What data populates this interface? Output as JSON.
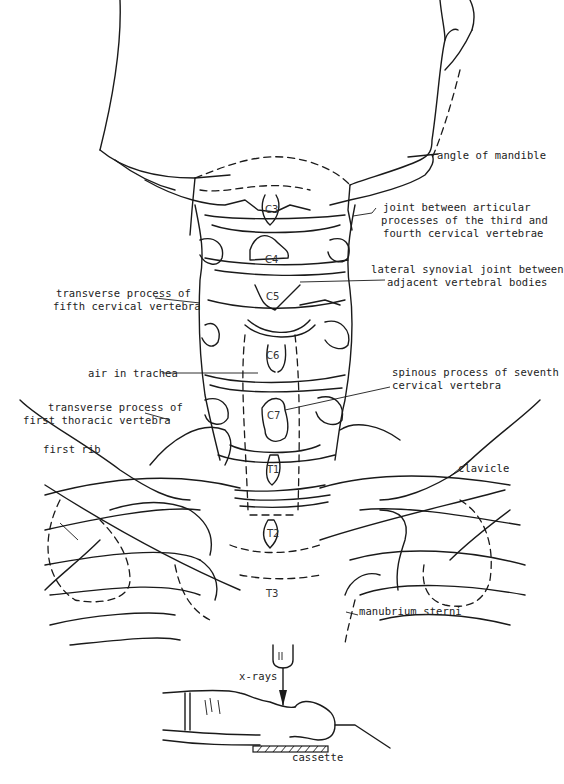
{
  "diagram": {
    "type": "anatomical line drawing",
    "labels": {
      "angle_of_mandible": "angle of mandible",
      "articular_joint_line1": "joint between articular",
      "articular_joint_line2": "processes of the third and",
      "articular_joint_line3": "fourth cervical vertebrae",
      "lateral_synovial_line1": "lateral synovial joint between",
      "lateral_synovial_line2": "adjacent vertebral bodies",
      "transverse_c5_line1": "transverse process of",
      "transverse_c5_line2": "fifth cervical vertebra",
      "air_in_trachea": "air in trachea",
      "spinous_c7_line1": "spinous process of seventh",
      "spinous_c7_line2": "cervical vertebra",
      "transverse_t1_line1": "transverse process of",
      "transverse_t1_line2": "first thoracic vertebra",
      "first_rib": "first rib",
      "clavicle": "clavicle",
      "manubrium_sterni": "manubrium sterni",
      "x_rays": "x-rays",
      "cassette": "cassette"
    },
    "vertebrae": {
      "c3": "C3",
      "c4": "C4",
      "c5": "C5",
      "c6": "C6",
      "c7": "C7",
      "t1": "T1",
      "t2": "T2",
      "t3": "T3"
    }
  }
}
